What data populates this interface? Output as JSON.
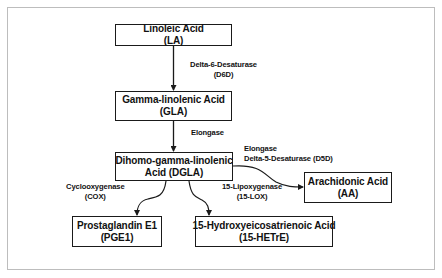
{
  "diagram": {
    "nodes": {
      "la": {
        "name": "Linoleic Acid",
        "abbr": "(LA)"
      },
      "gla": {
        "name": "Gamma-linolenic Acid",
        "abbr": "(GLA)"
      },
      "dgla": {
        "name": "Dihomo-gamma-linolenic",
        "abbr": "Acid (DGLA)"
      },
      "aa": {
        "name": "Arachidonic Acid",
        "abbr": "(AA)"
      },
      "pge1": {
        "name": "Prostaglandin E1",
        "abbr": "(PGE1)"
      },
      "hetre": {
        "name": "15-Hydroxyeicosatrienoic Acid",
        "abbr": "(15-HETrE)"
      }
    },
    "edges": {
      "la_gla": {
        "line1": "Delta-6-Desaturase",
        "line2": "(D6D)"
      },
      "gla_dgla": {
        "line1": "Elongase"
      },
      "dgla_aa": {
        "line1": "Elongase",
        "line2": "Delta-5-Desaturase (D5D)"
      },
      "dgla_pge1": {
        "line1": "Cyclooxygenase",
        "line2": "(COX)"
      },
      "dgla_hetre": {
        "line1": "15-Lipoxygenase",
        "line2": "(15-LOX)"
      }
    },
    "colors": {
      "stroke": "#1a1a1a",
      "frame": "#bdbdbd",
      "background": "#ffffff"
    }
  }
}
